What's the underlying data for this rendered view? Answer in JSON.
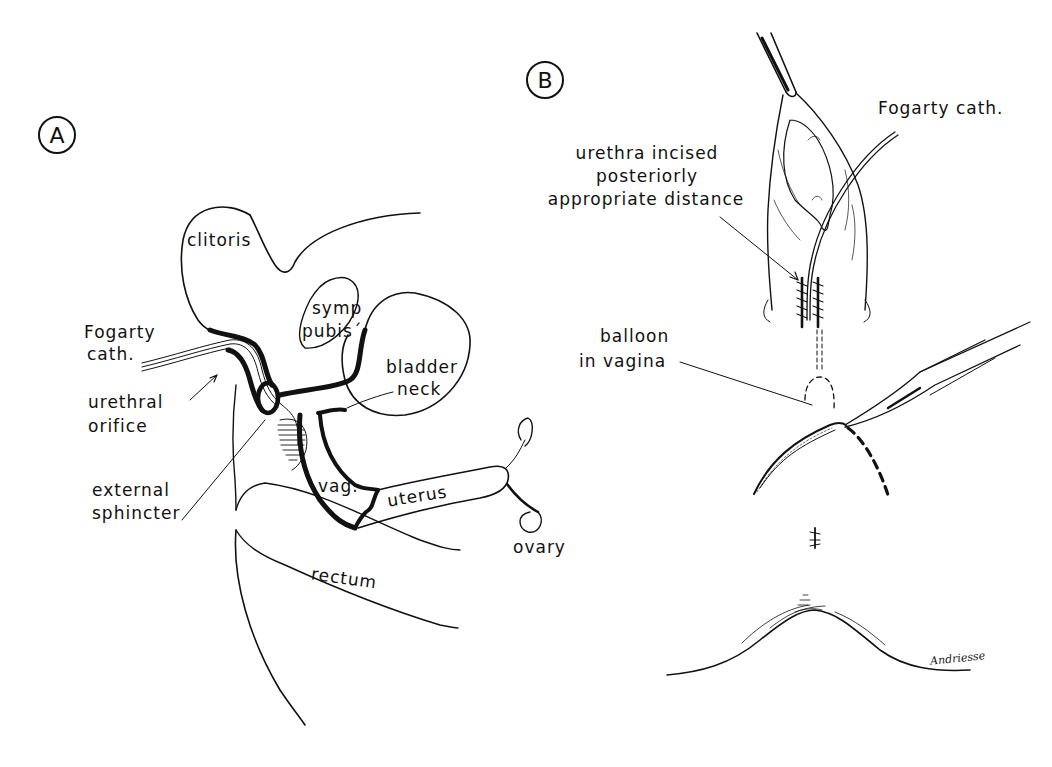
{
  "figure": {
    "panels": [
      {
        "id": "A",
        "badge": "A",
        "labels": {
          "clitoris": "clitoris",
          "symp_pubis_1": "symp",
          "symp_pubis_2": "pubis´",
          "fogarty_1": "Fogarty",
          "fogarty_2": "cath.",
          "urethral_1": "urethral",
          "urethral_2": "orifice",
          "bladder_1": "bladder",
          "bladder_2": "neck",
          "sphincter_1": "external",
          "sphincter_2": "sphincter",
          "vag": "vag.",
          "uterus": "uterus",
          "ovary": "ovary",
          "rectum": "rectum"
        }
      },
      {
        "id": "B",
        "badge": "B",
        "labels": {
          "fogarty": "Fogarty cath.",
          "incised_1": "urethra incised",
          "incised_2": "posteriorly",
          "incised_3": "appropriate distance",
          "balloon_1": "balloon",
          "balloon_2": "in vagina"
        },
        "signature": "Andriesse"
      }
    ],
    "colors": {
      "ink": "#111111",
      "background": "#ffffff"
    }
  }
}
